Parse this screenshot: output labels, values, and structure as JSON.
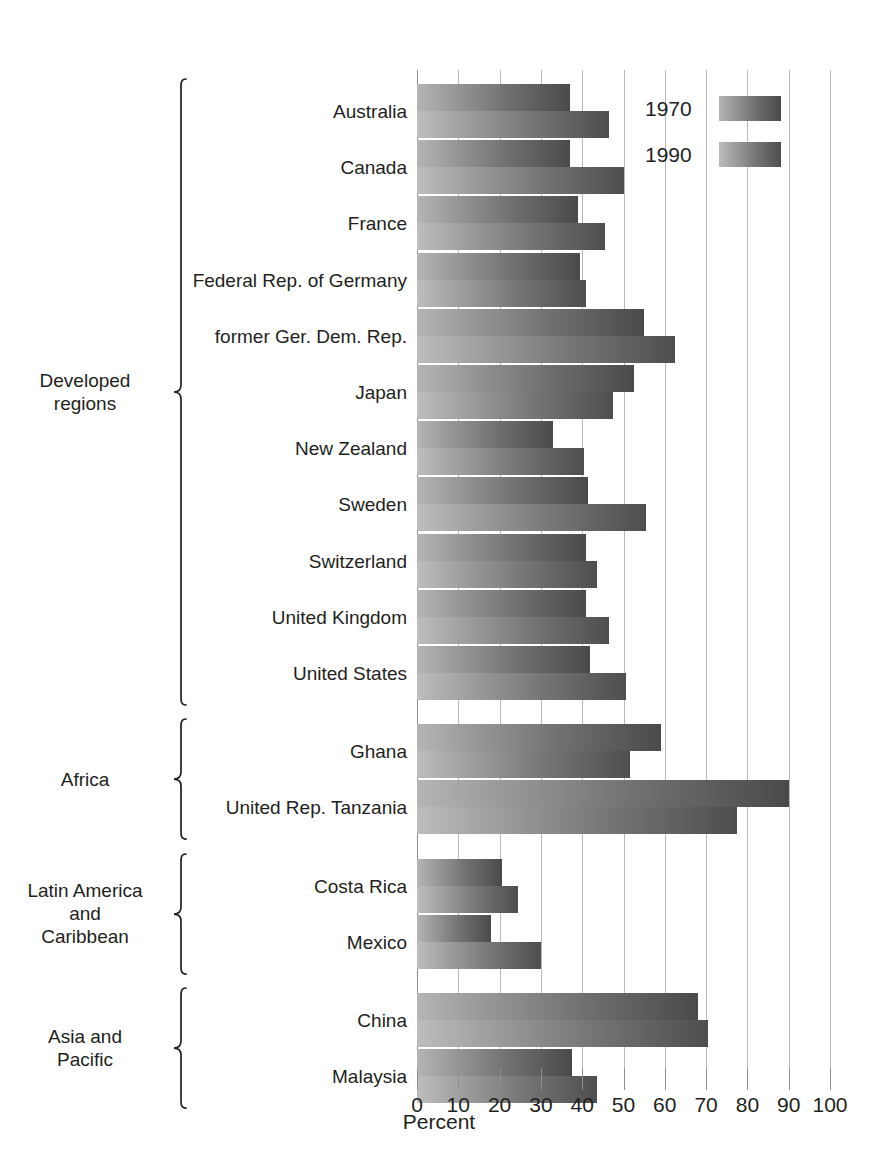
{
  "chart_data": {
    "type": "bar",
    "orientation": "horizontal",
    "title": "",
    "xlabel": "Percent",
    "ylabel": "",
    "xlim": [
      0,
      100
    ],
    "xticks": [
      "0",
      "10",
      "20",
      "30",
      "40",
      "50",
      "60",
      "70",
      "80",
      "90",
      "100"
    ],
    "grid": true,
    "legend_position": "top-right",
    "legend": [
      "1970",
      "1990"
    ],
    "series": [
      {
        "name": "1970",
        "values": [
          37,
          37,
          39,
          39.5,
          55,
          52.5,
          33,
          41.5,
          41,
          41,
          42,
          59,
          90,
          20.5,
          18,
          68,
          37.5
        ]
      },
      {
        "name": "1990",
        "values": [
          46.5,
          50,
          45.5,
          41,
          62.5,
          47.5,
          40.5,
          55.5,
          43.5,
          46.5,
          50.5,
          51.5,
          77.5,
          24.5,
          30,
          70.5,
          43.5
        ]
      }
    ],
    "categories": [
      "Australia",
      "Canada",
      "France",
      "Federal Rep. of Germany",
      "former Ger. Dem. Rep.",
      "Japan",
      "New Zealand",
      "Sweden",
      "Switzerland",
      "United Kingdom",
      "United States",
      "Ghana",
      "United Rep. Tanzania",
      "Costa Rica",
      "Mexico",
      "China",
      "Malaysia"
    ],
    "groups": [
      {
        "label": "Developed\nregions",
        "start": 0,
        "end": 10
      },
      {
        "label": "Africa",
        "start": 11,
        "end": 12
      },
      {
        "label": "Latin America\nand\nCaribbean",
        "start": 13,
        "end": 14
      },
      {
        "label": "Asia and\nPacific",
        "start": 15,
        "end": 16
      }
    ],
    "colors": {
      "series_1970_light": "#b5b5b5",
      "series_1970_dark": "#4a4a4a",
      "series_1990_light": "#bdbdbd",
      "series_1990_dark": "#4e4e4e",
      "gridline": "#b9b9b9",
      "text": "#231f20",
      "background": "#ffffff"
    }
  },
  "axis": {
    "title": "Percent"
  },
  "legend": {
    "items": [
      {
        "label": "1970"
      },
      {
        "label": "1990"
      }
    ]
  }
}
